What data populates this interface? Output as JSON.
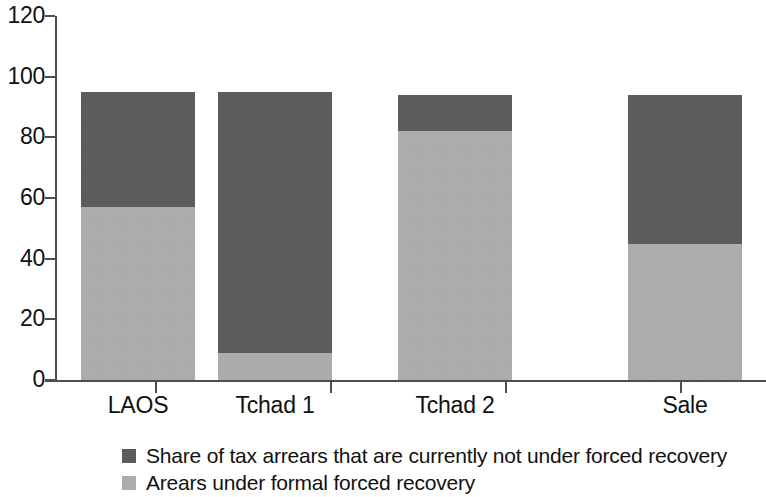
{
  "chart_data": {
    "type": "bar",
    "stacked": true,
    "title": "",
    "subtitle": "",
    "xlabel": "",
    "ylabel": "",
    "categories": [
      "LAOS",
      "Tchad 1",
      "Tchad 2",
      "Sale"
    ],
    "series": [
      {
        "name": "Arears under formal forced recovery",
        "color": "#b0b0b0",
        "values": [
          57,
          9,
          82,
          45
        ]
      },
      {
        "name": "Share of tax arrears that are currently not under forced recovery",
        "color": "#595959",
        "values": [
          38,
          86,
          12,
          49
        ]
      }
    ],
    "totals": [
      95,
      95,
      94,
      94
    ],
    "ylim": [
      0,
      120
    ],
    "ytick_labels": [
      "120",
      "100",
      "80",
      "60",
      "40",
      "20",
      "0"
    ],
    "ytick_values": [
      120,
      100,
      80,
      60,
      40,
      20,
      0
    ],
    "grid": false,
    "legend_position": "bottom",
    "legend": [
      {
        "label": "Share of tax arrears that are currently not under forced recovery",
        "swatch_color": "#595959"
      },
      {
        "label": "Arears under formal forced recovery",
        "swatch_color": "#b0b0b0"
      }
    ],
    "axis_color": "#4d4d4d"
  }
}
